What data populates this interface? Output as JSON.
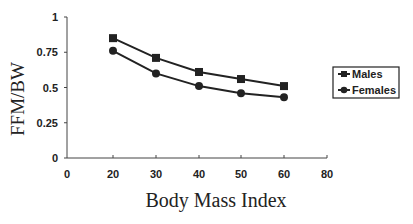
{
  "chart_data": {
    "type": "line",
    "title": "",
    "xlabel": "Body Mass Index",
    "ylabel": "FFM/BW",
    "x_tick_labels": [
      "0",
      "20",
      "30",
      "40",
      "50",
      "60",
      "80"
    ],
    "y_tick_labels": [
      "0",
      "0.25",
      "0.5",
      "0.75",
      "1"
    ],
    "ylim": [
      0,
      1
    ],
    "xlim": [
      0,
      80
    ],
    "grid": false,
    "legend_position": "right",
    "x": [
      20,
      30,
      40,
      50,
      60
    ],
    "series": [
      {
        "name": "Males",
        "marker": "square",
        "values": [
          0.85,
          0.71,
          0.61,
          0.56,
          0.51
        ]
      },
      {
        "name": "Females",
        "marker": "circle",
        "values": [
          0.76,
          0.6,
          0.51,
          0.46,
          0.43
        ]
      }
    ]
  },
  "legend": {
    "males": "Males",
    "females": "Females"
  },
  "colors": {
    "line": "#222222",
    "axis": "#444444"
  }
}
